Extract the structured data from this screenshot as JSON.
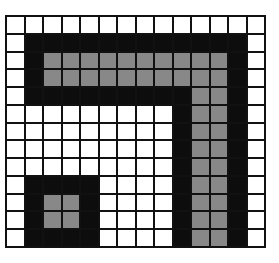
{
  "grid": {
    "rows": 13,
    "cols": 14,
    "colors": {
      "W": "#ffffff",
      "B": "#0d0d0d",
      "G": "#888888"
    },
    "cells": [
      "WWWWWWWWWWWWWW",
      "WBBBBBBBBBBBBW",
      "WBGGGGGGGGGGBW",
      "WBGGGGGGGGGGBW",
      "WBBBBBBBBBGGBW",
      "WWWWWWWWWBGGBW",
      "WWWWWWWWWBGGBW",
      "WWWWWWWWWBGGBW",
      "WWWWWWWWWBGGBW",
      "WBBBBWWWWBGGBW",
      "WBGGBWWWWBGGBW",
      "WBGGBWWWWBGGBW",
      "WBBBBWWWWBGGBW"
    ]
  }
}
